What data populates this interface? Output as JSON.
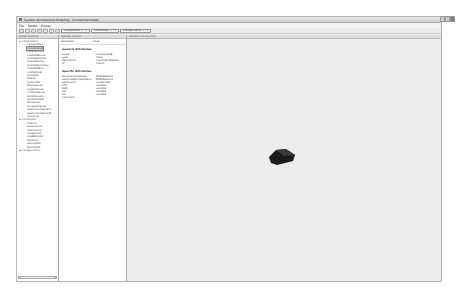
{
  "window": {
    "title": "System Architecture Modeling - [ComponentView]",
    "controls": [
      "minimize",
      "maximize",
      "close"
    ]
  },
  "menubar": {
    "items": [
      "File",
      "Model",
      "Extras"
    ]
  },
  "toolbar": {
    "buttons": [
      "new",
      "open",
      "save",
      "undo",
      "redo",
      "delete",
      "refresh"
    ],
    "tabs": [
      {
        "label": "Components"
      },
      {
        "label": "Connectors"
      },
      {
        "label": "Configurations"
      }
    ]
  },
  "explorer": {
    "header": "Project Explorer",
    "groups": [
      {
        "label": "Components",
        "items": [
          "ComponentA",
          "ComponentB",
          "LabelledPanel",
          "LabelledButton",
          "FramedWindow",
          "FramedDialog",
          "FramedMultiView",
          "FramedMenu",
          "ConfigPanel",
          "DataItem",
          "Palette",
          "Subscriber",
          "BillingServer",
          "LoggerServer",
          "ContentServer",
          "StoreServerA",
          "StoreServerB",
          "PortServer",
          "AccessorServer",
          "ApplicationServerA",
          "ApplicationServerB",
          "Visualizer"
        ],
        "selected_index": 1
      },
      {
        "label": "Connectors",
        "items": [
          "Internal",
          "ExternalLink",
          "InternalLink",
          "ImageLoad",
          "LoadElement",
          "PostData",
          "GettingFile",
          "SettingFile"
        ]
      },
      {
        "label": "Configurations",
        "items": []
      }
    ]
  },
  "details": {
    "header": "Element Details",
    "columns": [
      "Parameter",
      "Value"
    ],
    "general_title": "General Attributes",
    "general": [
      {
        "k": "name",
        "v": "ComponentB"
      },
      {
        "k": "type",
        "v": "client"
      },
      {
        "k": "description",
        "v": "Customer-Module"
      },
      {
        "k": "id",
        "v": "client2"
      }
    ],
    "specific_title": "Specific Attributes",
    "specific": [
      {
        "k": "physicalComponent",
        "v": "MobileDevice"
      },
      {
        "k": "associatedComponents",
        "v": "MobileDevice"
      },
      {
        "k": "application",
        "v": "unspecified"
      },
      {
        "k": "CPU",
        "v": "variable"
      },
      {
        "k": "RAM",
        "v": "variable"
      },
      {
        "k": "HD",
        "v": "variable"
      },
      {
        "k": "OS",
        "v": "variable"
      },
      {
        "k": "Constraint",
        "v": ""
      }
    ]
  },
  "visualization": {
    "header": "Element Visualization",
    "shape_color": "#1a1a1a",
    "background": "#ececec"
  }
}
